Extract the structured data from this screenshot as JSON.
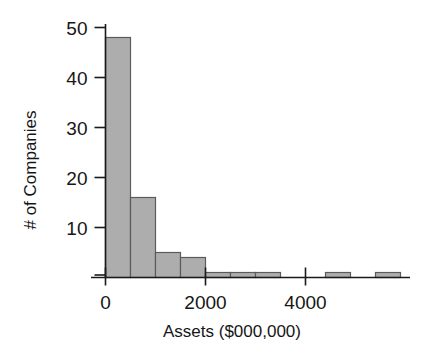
{
  "chart_data": {
    "type": "bar",
    "title": "",
    "subtitle": "",
    "xlabel": "Assets ($000,000)",
    "ylabel": "# of Companies",
    "grid": false,
    "legend": false,
    "legend_position": "none",
    "histogram": true,
    "bin_width": 500,
    "xlim": [
      0,
      6000
    ],
    "ylim": [
      0,
      50
    ],
    "xticks": [
      0,
      2000,
      4000
    ],
    "xtick_labels": [
      "0",
      "2000",
      "4000"
    ],
    "yticks": [
      10,
      20,
      30,
      40,
      50
    ],
    "ytick_labels": [
      "10",
      "20",
      "30",
      "40",
      "50"
    ],
    "bin_edges": [
      0,
      500,
      1000,
      1500,
      2000,
      2500,
      3000,
      3500,
      4000,
      4500,
      5000,
      5500,
      6000
    ],
    "categories": [
      "0-500",
      "500-1000",
      "1000-1500",
      "1500-2000",
      "2000-2500",
      "2500-3000",
      "3000-3500",
      "3500-4000",
      "4000-4500",
      "4500-5000",
      "5000-5500",
      "5500-6000"
    ],
    "values": [
      48,
      16,
      5,
      4,
      1,
      1,
      1,
      0,
      0,
      1,
      0,
      1
    ],
    "bars": [
      {
        "x0": 0,
        "x1": 500,
        "value": 48
      },
      {
        "x0": 500,
        "x1": 1000,
        "value": 16
      },
      {
        "x0": 1000,
        "x1": 1500,
        "value": 5
      },
      {
        "x0": 1500,
        "x1": 2000,
        "value": 4
      },
      {
        "x0": 2000,
        "x1": 2500,
        "value": 1
      },
      {
        "x0": 2500,
        "x1": 3000,
        "value": 1
      },
      {
        "x0": 3000,
        "x1": 3500,
        "value": 1
      },
      {
        "x0": 4400,
        "x1": 4900,
        "value": 1
      },
      {
        "x0": 5400,
        "x1": 5900,
        "value": 1
      }
    ],
    "colors": {
      "bar_fill": "#adadad",
      "bar_stroke": "#5a5a5a",
      "axis": "#1a1a1a",
      "text": "#161616",
      "background": "#ffffff"
    }
  }
}
